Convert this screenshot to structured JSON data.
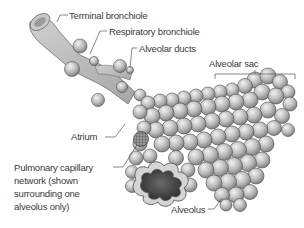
{
  "diagram": {
    "labels": {
      "terminal_bronchiole": "Terminal bronchiole",
      "respiratory_bronchiole": "Respiratory bronchiole",
      "alveolar_ducts": "Alveolar ducts",
      "alveolar_sac": "Alveolar sac",
      "atrium": "Atrium",
      "pulmonary_capillary_line1": "Pulmonary capillary",
      "pulmonary_capillary_line2": "network (shown",
      "pulmonary_capillary_line3": "surrounding one",
      "pulmonary_capillary_line4": "alveolus only)",
      "alveolus": "Alveolus"
    },
    "colors": {
      "tube_fill": "#bdbdbd",
      "tube_stroke": "#6e6e6e",
      "sphere_light": "#e8e8e8",
      "sphere_dark": "#8a8a8a",
      "sphere_stroke": "#4a4a4a",
      "capillary": "#7a7a7a",
      "cavity": "#3c3c3c",
      "leader_line": "#555555",
      "text": "#3a3a3a"
    }
  }
}
